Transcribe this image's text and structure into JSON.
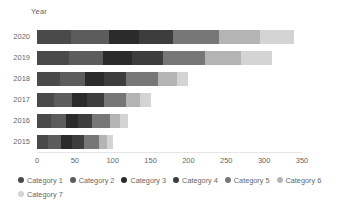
{
  "chart_data": {
    "type": "bar",
    "orientation": "horizontal",
    "stacked": true,
    "title": "",
    "xlabel": "",
    "ylabel": "Year",
    "categories": [
      "2020",
      "2019",
      "2018",
      "2017",
      "2016",
      "2015"
    ],
    "xlim": [
      0,
      350
    ],
    "xticks": [
      0,
      50,
      100,
      150,
      200,
      250,
      300,
      350
    ],
    "xticklabels": [
      "0",
      "50",
      "100",
      "150",
      "200",
      "250",
      "300",
      "350"
    ],
    "grid": false,
    "legend_position": "bottom",
    "series": [
      {
        "name": "Category 1",
        "color": "#4a4a4a",
        "values": [
          45,
          42,
          30,
          22,
          18,
          15
        ]
      },
      {
        "name": "Category 2",
        "color": "#5c5c5c",
        "values": [
          50,
          45,
          33,
          24,
          20,
          17
        ]
      },
      {
        "name": "Category 3",
        "color": "#2b2b2b",
        "values": [
          40,
          38,
          25,
          20,
          16,
          14
        ]
      },
      {
        "name": "Category 4",
        "color": "#3d3d3d",
        "values": [
          45,
          42,
          30,
          22,
          18,
          16
        ]
      },
      {
        "name": "Category 5",
        "color": "#777777",
        "values": [
          60,
          55,
          42,
          30,
          24,
          20
        ]
      },
      {
        "name": "Category 6",
        "color": "#b4b4b4",
        "values": [
          55,
          48,
          25,
          18,
          14,
          10
        ]
      },
      {
        "name": "Category 7",
        "color": "#d4d4d4",
        "values": [
          45,
          40,
          15,
          14,
          10,
          8
        ]
      }
    ],
    "totals": [
      340,
      310,
      200,
      150,
      120,
      100
    ]
  },
  "axis": {
    "y_title": "Year"
  }
}
